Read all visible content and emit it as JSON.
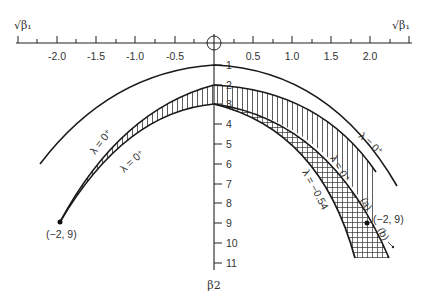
{
  "diagram": {
    "x_axis": {
      "label": "√β₁",
      "label_left": "√β1",
      "label_right": "√β1",
      "ticks": [
        "-2.0",
        "-1.5",
        "-1.0",
        "-0.5",
        "0.5",
        "1.0",
        "1.5",
        "2.0"
      ]
    },
    "y_axis": {
      "label": "β2",
      "ticks": [
        "1",
        "2",
        "3",
        "4",
        "5",
        "6",
        "7",
        "8",
        "9",
        "10",
        "11"
      ]
    },
    "curve_labels": {
      "upper_left_lambda": "λ = 0⁺",
      "lower_left_lambda": "λ = 0⁺",
      "upper_right_lambda": "λ = 0⁺",
      "middle_right_lambda": "λ = 0⁺",
      "lower_right_lambda": "λ = −0.54"
    },
    "points": {
      "left_point": "(−2, 9)",
      "right_point": "(−2, 9)"
    },
    "annotations": {
      "a": "(a)",
      "b": "(b)"
    },
    "colors": {
      "line": "#1a1a1a",
      "text": "#333333",
      "background": "#ffffff"
    }
  }
}
